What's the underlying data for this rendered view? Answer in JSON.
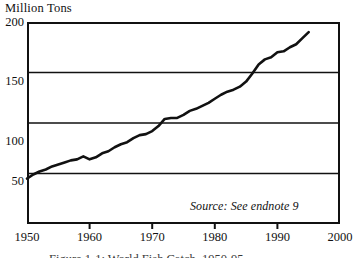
{
  "chart_data": {
    "type": "line",
    "title": "",
    "ylabel": "Million Tons",
    "xlabel": "",
    "xlim": [
      1950,
      2000
    ],
    "ylim": [
      0,
      200
    ],
    "grid": true,
    "legend": false,
    "yticks": [
      200,
      150,
      100,
      50
    ],
    "xticks": [
      1950,
      1960,
      1970,
      1980,
      1990,
      2000
    ],
    "annotations": [
      {
        "text": "Source: See endnote 9",
        "style": "italic"
      }
    ],
    "series": [
      {
        "name": "World fish catch",
        "color": "#111111",
        "x": [
          1950,
          1951,
          1952,
          1953,
          1954,
          1955,
          1956,
          1957,
          1958,
          1959,
          1960,
          1961,
          1962,
          1963,
          1964,
          1965,
          1966,
          1967,
          1968,
          1969,
          1970,
          1971,
          1972,
          1973,
          1974,
          1975,
          1976,
          1977,
          1978,
          1979,
          1980,
          1981,
          1982,
          1983,
          1984,
          1985,
          1986,
          1987,
          1988,
          1989,
          1990,
          1991,
          1992,
          1993,
          1994,
          1995
        ],
        "values": [
          45,
          49,
          52,
          54,
          57,
          59,
          61,
          63,
          64,
          67,
          64,
          66,
          70,
          72,
          76,
          79,
          81,
          85,
          88,
          89,
          92,
          97,
          104,
          105,
          105,
          108,
          112,
          114,
          117,
          120,
          124,
          128,
          131,
          133,
          136,
          141,
          149,
          158,
          163,
          165,
          170,
          171,
          175,
          178,
          184,
          190
        ]
      }
    ]
  },
  "caption": {
    "text": "Figure 1-1: World Fish Catch, 1950-95"
  }
}
